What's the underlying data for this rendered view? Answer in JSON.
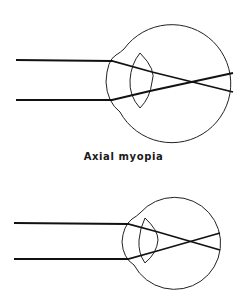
{
  "figure": {
    "caption": "Axial myopia",
    "top_eye": {
      "description": "eye with parallel light rays focusing in front of retina (elongated eyeball)"
    },
    "bottom_eye": {
      "description": "eye with parallel light rays focusing in front of retina (smaller eyeball)"
    }
  },
  "colors": {
    "line": "#111111",
    "background": "#ffffff"
  }
}
